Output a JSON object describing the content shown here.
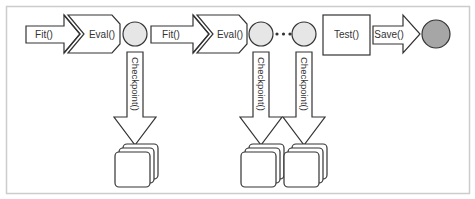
{
  "diagram": {
    "colors": {
      "stroke": "#333333",
      "frame": "#cccccc",
      "circle_fill": "#e6e6e6",
      "final_circle_fill": "#a6a6a6",
      "background": "#ffffff"
    },
    "steps": {
      "fit_1": "Fit()",
      "eval_1": "Eval()",
      "fit_2": "Fit()",
      "eval_2": "Eval()",
      "test": "Test()",
      "save": "Save()"
    },
    "checkpoints": [
      {
        "label": "Checkpoint()"
      },
      {
        "label": "Checkpoint()"
      },
      {
        "label": "Checkpoint()"
      }
    ],
    "ellipsis": "•••"
  }
}
